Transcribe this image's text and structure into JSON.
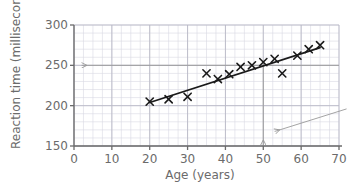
{
  "chart_data": {
    "type": "scatter",
    "title": "",
    "xlabel": "Age (years)",
    "ylabel": "Reaction time (milliseconds)",
    "xlim": [
      0,
      70
    ],
    "ylim": [
      150,
      300
    ],
    "xticks": [
      0,
      10,
      20,
      30,
      40,
      50,
      60,
      70
    ],
    "yticks": [
      150,
      200,
      250,
      300
    ],
    "xtick_labels": [
      "0",
      "10",
      "20",
      "30",
      "40",
      "50",
      "60",
      "70"
    ],
    "ytick_labels": [
      "150",
      "200",
      "250",
      "300"
    ],
    "x_minor_step": 2.5,
    "y_minor_step": 10,
    "grid": "both",
    "legend": "none",
    "marker": "x",
    "points": [
      {
        "x": 20,
        "y": 205
      },
      {
        "x": 25,
        "y": 208
      },
      {
        "x": 30,
        "y": 211
      },
      {
        "x": 35,
        "y": 240
      },
      {
        "x": 38,
        "y": 233
      },
      {
        "x": 41,
        "y": 239
      },
      {
        "x": 44,
        "y": 248
      },
      {
        "x": 47,
        "y": 250
      },
      {
        "x": 50,
        "y": 254
      },
      {
        "x": 53,
        "y": 258
      },
      {
        "x": 55,
        "y": 240
      },
      {
        "x": 59,
        "y": 262
      },
      {
        "x": 62,
        "y": 270
      },
      {
        "x": 65,
        "y": 275
      }
    ],
    "trend_line": {
      "x1": 20,
      "y1": 204,
      "x2": 65,
      "y2": 272
    },
    "annotations": [
      {
        "name": "reading-horizontal",
        "type": "arrow",
        "from_x": 70,
        "from_y": 250,
        "to_x": 2,
        "to_y": 250,
        "value": 250
      },
      {
        "name": "reading-vertical",
        "type": "arrow",
        "from_x": 50,
        "from_y": 254,
        "to_x": 50,
        "to_y": 151,
        "value": 50
      },
      {
        "name": "callout-pointer",
        "type": "arrow",
        "from_x": 72,
        "from_y": 196,
        "to_x": 53,
        "to_y": 168
      }
    ],
    "colors": {
      "axis": "#6b6b6b",
      "grid_minor": "#d9d9e3",
      "grid_major": "#b9b9c6",
      "marker": "#1a1a1a",
      "trend": "#1a1a1a",
      "annotation": "#9a9a9a"
    }
  }
}
